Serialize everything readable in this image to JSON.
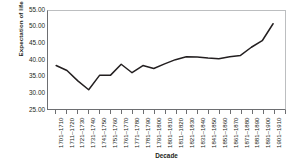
{
  "chart_data": {
    "type": "line",
    "title": "",
    "xlabel": "Decade",
    "ylabel": "Expectation of life (years)",
    "ylim": [
      25.0,
      55.0
    ],
    "ytick_labels": [
      "55.00",
      "50.00",
      "45.00",
      "40.00",
      "35.00",
      "30.00",
      "25.00"
    ],
    "ytick_values": [
      55.0,
      50.0,
      45.0,
      40.0,
      35.0,
      30.0,
      25.0
    ],
    "grid": false,
    "legend": "none",
    "line_color": "#231f20",
    "categories": [
      "1701–1710",
      "1711–1720",
      "1721–1730",
      "1731–1740",
      "1741–1750",
      "1751–1760",
      "1761–1770",
      "1771–1780",
      "1781–1790",
      "1791–1800",
      "1801–1810",
      "1811–1820",
      "1821–1830",
      "1831–1840",
      "1841–1850",
      "1851–1860",
      "1861–1870",
      "1871–1880",
      "1881–1890",
      "1891–1900",
      "1901–1910"
    ],
    "values": [
      38.3,
      36.8,
      33.6,
      30.9,
      35.3,
      35.3,
      38.7,
      36.1,
      38.3,
      37.4,
      38.8,
      40.1,
      41.0,
      40.9,
      40.6,
      40.4,
      41.0,
      41.4,
      43.9,
      45.9,
      51.1
    ]
  }
}
